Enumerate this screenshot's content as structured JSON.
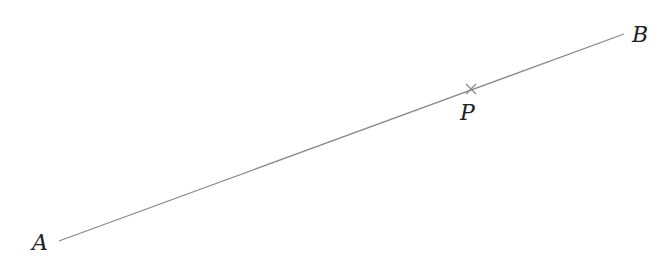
{
  "diagram": {
    "points": {
      "A": {
        "label": "A",
        "x": 59,
        "y": 241,
        "label_x": 32,
        "label_y": 250
      },
      "B": {
        "label": "B",
        "x": 624,
        "y": 34,
        "label_x": 632,
        "label_y": 42
      },
      "P": {
        "label": "P",
        "x": 471,
        "y": 89,
        "label_x": 460,
        "label_y": 120
      }
    },
    "segment": {
      "from": "A",
      "to": "B",
      "color": "#888888"
    },
    "marker": {
      "point": "P",
      "style": "cross",
      "color": "#888888"
    }
  }
}
